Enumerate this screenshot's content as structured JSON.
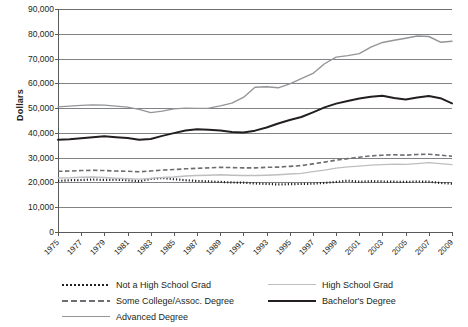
{
  "chart_data": {
    "type": "line",
    "title": "",
    "xlabel": "",
    "ylabel": "Dollars",
    "ylim": [
      0,
      90000
    ],
    "xlim": [
      1975,
      2009
    ],
    "grid": true,
    "legend_position": "bottom",
    "ytick_labels": [
      "90,000",
      "80,000",
      "70,000",
      "60,000",
      "50,000",
      "40,000",
      "30,000",
      "20,000",
      "10,000",
      "0"
    ],
    "ytick_values": [
      90000,
      80000,
      70000,
      60000,
      50000,
      40000,
      30000,
      20000,
      10000,
      0
    ],
    "xtick_labels": [
      "1975",
      "1977",
      "1979",
      "1981",
      "1983",
      "1985",
      "1987",
      "1989",
      "1991",
      "1993",
      "1995",
      "1997",
      "1999",
      "2001",
      "2003",
      "2005",
      "2007",
      "2009"
    ],
    "x": [
      1975,
      1976,
      1977,
      1978,
      1979,
      1980,
      1981,
      1982,
      1983,
      1984,
      1985,
      1986,
      1987,
      1988,
      1989,
      1990,
      1991,
      1992,
      1993,
      1994,
      1995,
      1996,
      1997,
      1998,
      1999,
      2000,
      2001,
      2002,
      2003,
      2004,
      2005,
      2006,
      2007,
      2008,
      2009
    ],
    "series": [
      {
        "name": "Not a High School Grad",
        "style": "dotted",
        "color": "#231f20",
        "values": [
          20600,
          20900,
          21000,
          21200,
          21000,
          21100,
          20900,
          20500,
          21400,
          21800,
          21300,
          20900,
          20600,
          20400,
          20200,
          20000,
          19900,
          19600,
          19400,
          19200,
          19300,
          19400,
          19500,
          19800,
          20200,
          20700,
          20300,
          20500,
          20400,
          20300,
          20200,
          20400,
          20300,
          19800,
          19500
        ]
      },
      {
        "name": "High School Grad",
        "style": "solid-light",
        "color": "#bcbec0",
        "values": [
          21800,
          21900,
          22100,
          22200,
          22000,
          21700,
          21500,
          21300,
          21600,
          22000,
          22200,
          22600,
          22800,
          22900,
          23100,
          22900,
          22800,
          22800,
          22900,
          23100,
          23400,
          23700,
          24400,
          25000,
          25800,
          26300,
          26600,
          27000,
          27200,
          27400,
          27300,
          27600,
          28000,
          27600,
          27200
        ]
      },
      {
        "name": "Some College/Assoc. Degree",
        "style": "dashed",
        "color": "#6d6e71",
        "values": [
          24500,
          24600,
          24800,
          24900,
          24800,
          24600,
          24500,
          24300,
          24600,
          25000,
          25200,
          25500,
          25700,
          25900,
          26100,
          26000,
          25900,
          25900,
          26100,
          26200,
          26500,
          26800,
          27500,
          28200,
          29000,
          29600,
          30200,
          30700,
          31000,
          31200,
          31000,
          31300,
          31400,
          31000,
          30600
        ]
      },
      {
        "name": "Bachelor's Degree",
        "style": "solid-dark",
        "color": "#231f20",
        "values": [
          37200,
          37400,
          37800,
          38200,
          38600,
          38200,
          37900,
          37200,
          37500,
          38800,
          39900,
          41000,
          41500,
          41300,
          41000,
          40400,
          40200,
          40900,
          42200,
          43800,
          45200,
          46400,
          48300,
          50300,
          51800,
          52900,
          53900,
          54600,
          55000,
          54100,
          53500,
          54300,
          54900,
          54000,
          51900
        ]
      },
      {
        "name": "Advanced Degree",
        "style": "solid-gray",
        "color": "#939598",
        "values": [
          50500,
          50800,
          51100,
          51300,
          51200,
          50800,
          50400,
          49500,
          48200,
          48800,
          49700,
          50000,
          49900,
          50000,
          50900,
          52000,
          54300,
          58400,
          58600,
          58200,
          59800,
          61900,
          64000,
          67900,
          70600,
          71200,
          72000,
          74600,
          76500,
          77400,
          78200,
          79100,
          78900,
          76600,
          77000
        ]
      }
    ]
  },
  "legend": {
    "items": [
      {
        "label": "Not a High School Grad",
        "style": "dotted"
      },
      {
        "label": "Some College/Assoc. Degree",
        "style": "dashed"
      },
      {
        "label": "Advanced Degree",
        "style": "solid-gray"
      },
      {
        "label": "High School Grad",
        "style": "solid-light"
      },
      {
        "label": "Bachelor's Degree",
        "style": "solid-dark"
      }
    ]
  }
}
